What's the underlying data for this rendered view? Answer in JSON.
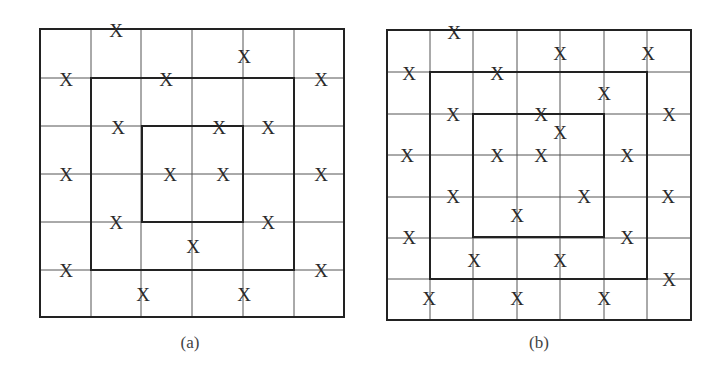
{
  "figures": [
    {
      "id": "a",
      "caption": "(a)",
      "caption_pos": [
        190,
        342
      ],
      "grid": {
        "xs": [
          40,
          91,
          141,
          192,
          243,
          294,
          344
        ],
        "ys": [
          29,
          78,
          126,
          174,
          222,
          270,
          317
        ]
      },
      "boxes": [
        {
          "name": "outer",
          "x1": 40,
          "y1": 29,
          "x2": 344,
          "y2": 317
        },
        {
          "name": "middle",
          "x1": 91,
          "y1": 78,
          "x2": 294,
          "y2": 270
        },
        {
          "name": "inner",
          "x1": 142,
          "y1": 126,
          "x2": 243,
          "y2": 222
        }
      ],
      "marks": [
        [
          116,
          30
        ],
        [
          244,
          56
        ],
        [
          66,
          79
        ],
        [
          166,
          79
        ],
        [
          321,
          79
        ],
        [
          118,
          127
        ],
        [
          219,
          127
        ],
        [
          268,
          127
        ],
        [
          66,
          174
        ],
        [
          170,
          174
        ],
        [
          223,
          174
        ],
        [
          321,
          174
        ],
        [
          116,
          222
        ],
        [
          268,
          222
        ],
        [
          193,
          246
        ],
        [
          66,
          270
        ],
        [
          321,
          270
        ],
        [
          143,
          294
        ],
        [
          244,
          294
        ]
      ],
      "mark_label": "X"
    },
    {
      "id": "b",
      "caption": "(b)",
      "caption_pos": [
        539,
        342
      ],
      "grid": {
        "xs": [
          387,
          430,
          473,
          517,
          560,
          604,
          647,
          691
        ],
        "ys": [
          30,
          72,
          114,
          155,
          197,
          238,
          279,
          320
        ]
      },
      "boxes": [
        {
          "name": "outer",
          "x1": 387,
          "y1": 30,
          "x2": 691,
          "y2": 320
        },
        {
          "name": "middle",
          "x1": 430,
          "y1": 72,
          "x2": 647,
          "y2": 279
        },
        {
          "name": "inner",
          "x1": 473,
          "y1": 114,
          "x2": 604,
          "y2": 237
        }
      ],
      "marks": [
        [
          454,
          32
        ],
        [
          560,
          53
        ],
        [
          648,
          53
        ],
        [
          409,
          73
        ],
        [
          497,
          73
        ],
        [
          604,
          93
        ],
        [
          453,
          114
        ],
        [
          541,
          114
        ],
        [
          669,
          114
        ],
        [
          560,
          132
        ],
        [
          407,
          155
        ],
        [
          497,
          155
        ],
        [
          541,
          155
        ],
        [
          627,
          155
        ],
        [
          453,
          196
        ],
        [
          584,
          196
        ],
        [
          668,
          196
        ],
        [
          517,
          215
        ],
        [
          409,
          237
        ],
        [
          627,
          237
        ],
        [
          474,
          260
        ],
        [
          560,
          260
        ],
        [
          669,
          279
        ],
        [
          429,
          298
        ],
        [
          517,
          298
        ],
        [
          604,
          298
        ]
      ],
      "mark_label": "X"
    }
  ]
}
